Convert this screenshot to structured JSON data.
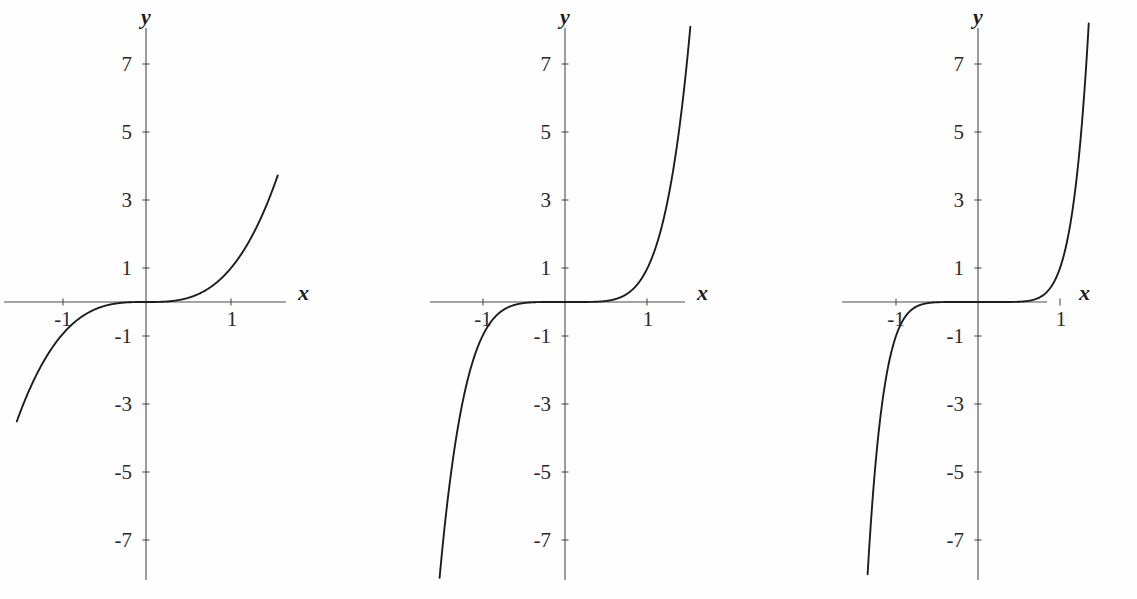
{
  "figure": {
    "background_color": "#fefefe",
    "axis_color": "#4a4a52",
    "curve_color": "#1d1d20",
    "panel_count": 3
  },
  "chart_data": [
    {
      "type": "line",
      "title": "",
      "subtitle": "",
      "xlabel": "x",
      "ylabel": "y",
      "expression": "y = x^3",
      "exponent": 3,
      "xlim": [
        -1.52,
        1.55
      ],
      "ylim": [
        -8.2,
        8.2
      ],
      "grid": false,
      "legend": "none",
      "xticks": [
        -1,
        1
      ],
      "xticklabels": [
        "-1",
        "1"
      ],
      "yticks": [
        -7,
        -5,
        -3,
        -1,
        1,
        3,
        5,
        7
      ],
      "yticklabels": [
        "-7",
        "-5",
        "-3",
        "-1",
        "1",
        "3",
        "5",
        "7"
      ],
      "annotations": [],
      "x": [
        -1.52,
        -1.4,
        -1.3,
        -1.2,
        -1.1,
        -1.0,
        -0.9,
        -0.8,
        -0.7,
        -0.6,
        -0.5,
        -0.4,
        -0.3,
        -0.2,
        -0.1,
        0.0,
        0.1,
        0.2,
        0.3,
        0.4,
        0.5,
        0.6,
        0.7,
        0.8,
        0.9,
        1.0,
        1.1,
        1.2,
        1.3,
        1.4,
        1.55
      ],
      "y": [
        -3.512,
        -2.744,
        -2.197,
        -1.728,
        -1.331,
        -1.0,
        -0.729,
        -0.512,
        -0.343,
        -0.216,
        -0.125,
        -0.064,
        -0.027,
        -0.008,
        -0.001,
        0.0,
        0.001,
        0.008,
        0.027,
        0.064,
        0.125,
        0.216,
        0.343,
        0.512,
        0.729,
        1.0,
        1.331,
        1.728,
        2.197,
        2.744,
        3.724
      ]
    },
    {
      "type": "line",
      "title": "",
      "subtitle": "",
      "xlabel": "x",
      "ylabel": "y",
      "expression": "y = x^5",
      "exponent": 5,
      "xlim": [
        -1.52,
        1.55
      ],
      "ylim": [
        -8.2,
        8.2
      ],
      "grid": false,
      "legend": "none",
      "xticks": [
        -1,
        1
      ],
      "xticklabels": [
        "-1",
        "1"
      ],
      "yticks": [
        -7,
        -5,
        -3,
        -1,
        1,
        3,
        5,
        7
      ],
      "yticklabels": [
        "-7",
        "-5",
        "-3",
        "-1",
        "1",
        "3",
        "5",
        "7"
      ],
      "annotations": [],
      "x": [
        -1.5,
        -1.45,
        -1.4,
        -1.3,
        -1.2,
        -1.1,
        -1.0,
        -0.9,
        -0.8,
        -0.7,
        -0.6,
        -0.5,
        -0.4,
        -0.3,
        -0.2,
        -0.1,
        0.0,
        0.1,
        0.2,
        0.3,
        0.4,
        0.5,
        0.6,
        0.7,
        0.8,
        0.9,
        1.0,
        1.1,
        1.2,
        1.3,
        1.4,
        1.5
      ],
      "y": [
        -7.594,
        -6.41,
        -5.378,
        -3.713,
        -2.488,
        -1.611,
        -1.0,
        -0.59,
        -0.328,
        -0.168,
        -0.078,
        -0.031,
        -0.01,
        -0.002,
        -0.0,
        -0.0,
        0.0,
        0.0,
        0.0,
        0.002,
        0.01,
        0.031,
        0.078,
        0.168,
        0.328,
        0.59,
        1.0,
        1.611,
        2.488,
        3.713,
        5.378,
        7.594
      ]
    },
    {
      "type": "line",
      "title": "",
      "subtitle": "",
      "xlabel": "x",
      "ylabel": "y",
      "expression": "y = x^7",
      "exponent": 7,
      "xlim": [
        -1.52,
        1.55
      ],
      "ylim": [
        -8.2,
        8.2
      ],
      "grid": false,
      "legend": "none",
      "xticks": [
        -1,
        1
      ],
      "xticklabels": [
        "-1",
        "1"
      ],
      "yticks": [
        -7,
        -5,
        -3,
        -1,
        1,
        3,
        5,
        7
      ],
      "yticklabels": [
        "-7",
        "-5",
        "-3",
        "-1",
        "1",
        "3",
        "5",
        "7"
      ],
      "annotations": [],
      "x": [
        -1.35,
        -1.32,
        -1.3,
        -1.25,
        -1.2,
        -1.15,
        -1.1,
        -1.05,
        -1.0,
        -0.95,
        -0.9,
        -0.8,
        -0.7,
        -0.6,
        -0.5,
        -0.4,
        -0.3,
        -0.2,
        -0.1,
        0.0,
        0.1,
        0.2,
        0.3,
        0.4,
        0.5,
        0.6,
        0.7,
        0.8,
        0.9,
        0.95,
        1.0,
        1.05,
        1.1,
        1.15,
        1.2,
        1.25,
        1.3,
        1.32,
        1.35
      ],
      "y": [
        -8.172,
        -7.128,
        -6.275,
        -4.768,
        -3.583,
        -2.66,
        -1.949,
        -1.407,
        -1.0,
        -0.698,
        -0.478,
        -0.21,
        -0.082,
        -0.028,
        -0.008,
        -0.002,
        -0.0,
        -0.0,
        -0.0,
        0.0,
        0.0,
        0.0,
        0.0,
        0.002,
        0.008,
        0.028,
        0.082,
        0.21,
        0.478,
        0.698,
        1.0,
        1.407,
        1.949,
        2.66,
        3.583,
        4.768,
        6.275,
        7.128,
        8.172
      ]
    }
  ],
  "panels": [
    {
      "id": "panel-1",
      "expression": "y = x^3",
      "axis_x_label": "x",
      "axis_y_label": "y",
      "x_tick_labels": [
        "-1",
        "1"
      ],
      "y_tick_labels": [
        "7",
        "5",
        "3",
        "1",
        "-1",
        "-3",
        "-5",
        "-7"
      ]
    },
    {
      "id": "panel-2",
      "expression": "y = x^5",
      "axis_x_label": "x",
      "axis_y_label": "y",
      "x_tick_labels": [
        "-1",
        "1"
      ],
      "y_tick_labels": [
        "7",
        "5",
        "3",
        "1",
        "-1",
        "-3",
        "-5",
        "-7"
      ]
    },
    {
      "id": "panel-3",
      "expression": "y = x^7",
      "axis_x_label": "x",
      "axis_y_label": "y",
      "x_tick_labels": [
        "-1",
        "1"
      ],
      "y_tick_labels": [
        "7",
        "5",
        "3",
        "1",
        "-1",
        "-3",
        "-5",
        "-7"
      ]
    }
  ]
}
